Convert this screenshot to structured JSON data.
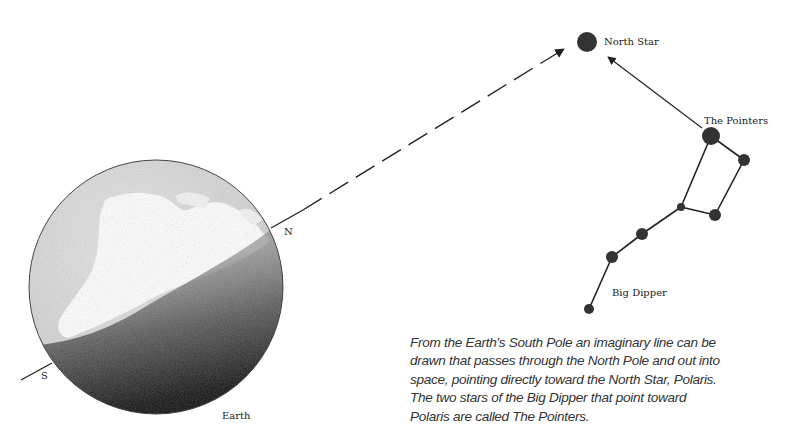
{
  "labels": {
    "north_star": "North Star",
    "pointers": "The Pointers",
    "big_dipper": "Big Dipper",
    "north_pole": "N",
    "south_pole": "S",
    "earth": "Earth"
  },
  "caption": {
    "lines": [
      "From the Earth's South Pole an imaginary line can be",
      "drawn that passes through the North Pole and out into",
      "space, pointing directly toward the North Star, Polaris.",
      "The two stars of the Big Dipper that point toward",
      "Polaris are called The Pointers."
    ]
  },
  "colors": {
    "ink": "#222222",
    "star": "#333333",
    "land": "#ffffff",
    "ocean_light": "#d6d6d6",
    "shadow": "#111111"
  },
  "stars": {
    "north_star": {
      "x": 587,
      "y": 42,
      "r": 10
    },
    "big_dipper": [
      {
        "name": "pointer-top",
        "x": 711,
        "y": 136,
        "r": 9
      },
      {
        "name": "pointer-bottom",
        "x": 744,
        "y": 160,
        "r": 6
      },
      {
        "name": "bowl-bottom-right",
        "x": 715,
        "y": 215,
        "r": 6
      },
      {
        "name": "bowl-bottom-left",
        "x": 681,
        "y": 207,
        "r": 4
      },
      {
        "name": "handle-1",
        "x": 642,
        "y": 234,
        "r": 6
      },
      {
        "name": "handle-2",
        "x": 612,
        "y": 257,
        "r": 6
      },
      {
        "name": "handle-end",
        "x": 589,
        "y": 309,
        "r": 5
      }
    ]
  }
}
